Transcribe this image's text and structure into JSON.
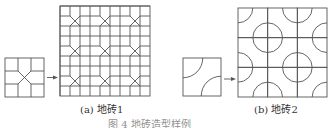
{
  "figure": {
    "caption_a": "(a) 地砖1",
    "caption_b": "(b) 地砖2",
    "caption_main": "图 4 地砖造型样例",
    "stroke_color": "#555555"
  },
  "tile1": {
    "small": {
      "x": 5,
      "y": 58,
      "size": 39
    },
    "large": {
      "x": 60,
      "y": 6,
      "size": 90,
      "cells": 9
    }
  },
  "tile2": {
    "small": {
      "x": 183,
      "y": 58,
      "size": 38
    },
    "large": {
      "x": 238,
      "y": 8,
      "size": 89,
      "cells": 3
    }
  }
}
